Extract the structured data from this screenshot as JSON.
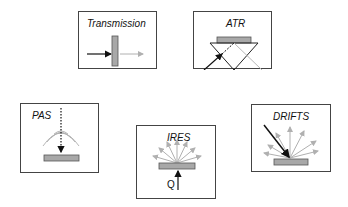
{
  "panels": [
    {
      "id": "transmission",
      "title": "Transmission"
    },
    {
      "id": "atr",
      "title": "ATR"
    },
    {
      "id": "pas",
      "title": "PAS"
    },
    {
      "id": "ires",
      "title": "IRES",
      "heat_label": "Q"
    },
    {
      "id": "drifts",
      "title": "DRIFTS"
    }
  ],
  "colors": {
    "sample_fill": "#a8a8a8",
    "sample_stroke": "#555555",
    "border": "#444444",
    "incident_ray": "#111111",
    "emitted_ray": "#b0b0b0"
  }
}
